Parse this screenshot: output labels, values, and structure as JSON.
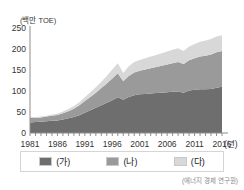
{
  "chart_data": {
    "type": "area",
    "stacked": true,
    "title": "",
    "xlabel": "(년)",
    "ylabel": "",
    "unit_label": "(백만 TOE)",
    "source": "(에너지 경제 연구원)",
    "grid": false,
    "legend_position": "bottom",
    "xlim": [
      1981,
      2016
    ],
    "ylim": [
      0,
      250
    ],
    "yticks": [
      0,
      50,
      100,
      150,
      200,
      250
    ],
    "xticks": [
      "1981",
      "1986",
      "1991",
      "1996",
      "2001",
      "2006",
      "2011",
      "2016"
    ],
    "x": [
      1981,
      1982,
      1983,
      1984,
      1985,
      1986,
      1987,
      1988,
      1989,
      1990,
      1991,
      1992,
      1993,
      1994,
      1995,
      1996,
      1997,
      1998,
      1999,
      2000,
      2001,
      2002,
      2003,
      2004,
      2005,
      2006,
      2007,
      2008,
      2009,
      2010,
      2011,
      2012,
      2013,
      2014,
      2015,
      2016
    ],
    "series": [
      {
        "name": "(가)",
        "color": "#6e6e6e",
        "values": [
          25,
          26,
          27,
          28,
          29,
          30,
          32,
          35,
          38,
          42,
          48,
          54,
          60,
          66,
          72,
          78,
          85,
          79,
          86,
          90,
          92,
          93,
          94,
          95,
          96,
          97,
          98,
          99,
          96,
          101,
          103,
          104,
          104,
          105,
          108,
          110
        ]
      },
      {
        "name": "(나)",
        "color": "#9a9a9a",
        "values": [
          11,
          10,
          10,
          11,
          12,
          13,
          15,
          17,
          20,
          24,
          28,
          32,
          36,
          41,
          46,
          52,
          57,
          44,
          50,
          54,
          56,
          58,
          60,
          62,
          64,
          66,
          68,
          70,
          68,
          72,
          75,
          78,
          80,
          82,
          84,
          85
        ]
      },
      {
        "name": "(다)",
        "color": "#d8d8d8",
        "values": [
          2,
          2,
          2,
          2,
          3,
          3,
          4,
          5,
          6,
          7,
          9,
          11,
          13,
          15,
          18,
          21,
          24,
          20,
          23,
          25,
          26,
          27,
          28,
          29,
          30,
          31,
          32,
          33,
          31,
          33,
          34,
          35,
          36,
          37,
          38,
          38
        ]
      }
    ],
    "stack_totals": [
      38,
      38,
      39,
      41,
      44,
      46,
      51,
      57,
      64,
      73,
      85,
      97,
      109,
      122,
      136,
      151,
      166,
      143,
      159,
      169,
      174,
      178,
      182,
      186,
      190,
      194,
      198,
      202,
      195,
      206,
      212,
      217,
      220,
      224,
      230,
      233
    ]
  },
  "legend": {
    "items": [
      {
        "label": "(가)",
        "color": "#6e6e6e"
      },
      {
        "label": "(나)",
        "color": "#9a9a9a"
      },
      {
        "label": "(다)",
        "color": "#d8d8d8"
      }
    ]
  }
}
